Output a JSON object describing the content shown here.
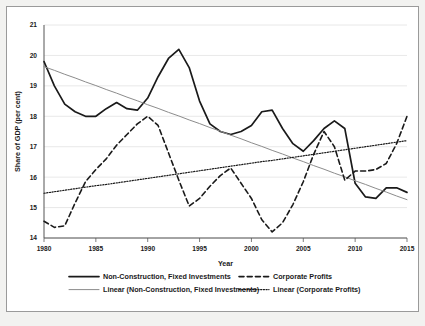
{
  "chart_data": {
    "type": "line",
    "title": "",
    "xlabel": "Year",
    "ylabel": "Share of GDP (per cent)",
    "xlim": [
      1980,
      2015
    ],
    "ylim": [
      14,
      21
    ],
    "xticks": [
      1980,
      1985,
      1990,
      1995,
      2000,
      2005,
      2010,
      2015
    ],
    "yticks": [
      14,
      15,
      16,
      17,
      18,
      19,
      20,
      21
    ],
    "grid": true,
    "legend_position": "bottom",
    "x": [
      1980,
      1981,
      1982,
      1983,
      1984,
      1985,
      1986,
      1987,
      1988,
      1989,
      1990,
      1991,
      1992,
      1993,
      1994,
      1995,
      1996,
      1997,
      1998,
      1999,
      2000,
      2001,
      2002,
      2003,
      2004,
      2005,
      2006,
      2007,
      2008,
      2009,
      2010,
      2011,
      2012,
      2013,
      2014,
      2015
    ],
    "series": [
      {
        "name": "Non-Construction, Fixed Investments",
        "style": "solid",
        "color": "#1a1a1a",
        "values": [
          19.8,
          19.0,
          18.4,
          18.15,
          18.0,
          18.0,
          18.25,
          18.45,
          18.25,
          18.2,
          18.6,
          19.3,
          19.9,
          20.2,
          19.6,
          18.5,
          17.75,
          17.5,
          17.4,
          17.5,
          17.7,
          18.15,
          18.2,
          17.6,
          17.1,
          16.85,
          17.2,
          17.6,
          17.85,
          17.6,
          15.8,
          15.35,
          15.3,
          15.65,
          15.65,
          15.5
        ]
      },
      {
        "name": "Linear (Non-Construction, Fixed Investments)",
        "style": "solid-thin",
        "color": "#8c8c8c",
        "values": [
          19.63,
          19.51,
          19.38,
          19.26,
          19.13,
          19.01,
          18.88,
          18.76,
          18.63,
          18.51,
          18.38,
          18.26,
          18.13,
          18.01,
          17.88,
          17.76,
          17.63,
          17.51,
          17.38,
          17.26,
          17.13,
          17.01,
          16.88,
          16.76,
          16.63,
          16.51,
          16.38,
          16.26,
          16.13,
          16.01,
          15.88,
          15.76,
          15.63,
          15.51,
          15.38,
          15.26
        ]
      },
      {
        "name": "Corporate Profits",
        "style": "dashed",
        "color": "#1a1a1a",
        "values": [
          14.55,
          14.35,
          14.4,
          15.15,
          15.85,
          16.25,
          16.6,
          17.05,
          17.4,
          17.75,
          18.0,
          17.7,
          16.8,
          15.9,
          15.05,
          15.3,
          15.7,
          16.05,
          16.3,
          15.8,
          15.3,
          14.6,
          14.2,
          14.5,
          15.1,
          15.85,
          16.75,
          17.5,
          17.0,
          15.9,
          16.2,
          16.2,
          16.25,
          16.45,
          17.1,
          18.0
        ]
      },
      {
        "name": "Linear (Corporate Profits)",
        "style": "dotted",
        "color": "#1a1a1a",
        "values": [
          15.47,
          15.52,
          15.57,
          15.62,
          15.67,
          15.72,
          15.76,
          15.81,
          15.86,
          15.91,
          15.96,
          16.01,
          16.06,
          16.11,
          16.16,
          16.21,
          16.26,
          16.31,
          16.36,
          16.41,
          16.46,
          16.51,
          16.55,
          16.6,
          16.65,
          16.7,
          16.75,
          16.8,
          16.85,
          16.9,
          16.95,
          17.0,
          17.05,
          17.1,
          17.15,
          17.2
        ]
      }
    ],
    "legend": [
      {
        "label": "Non-Construction, Fixed Investments",
        "style": "solid",
        "color": "#1a1a1a"
      },
      {
        "label": "Corporate Profits",
        "style": "dashed",
        "color": "#1a1a1a"
      },
      {
        "label": "Linear (Non-Construction, Fixed Investments)",
        "style": "solid-thin",
        "color": "#8c8c8c"
      },
      {
        "label": "Linear (Corporate Profits)",
        "style": "dotted",
        "color": "#1a1a1a"
      }
    ]
  }
}
